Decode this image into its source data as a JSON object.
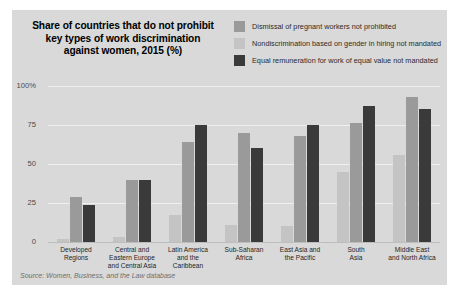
{
  "figure": {
    "title_lines": [
      "Share of countries that do not prohibit",
      "key types of work discrimination",
      "against women, 2015 (%)"
    ],
    "source_note": "Source: Women, Business, and the Law database",
    "panel_background": "#d9d9d9",
    "gridline_color": "#efefef"
  },
  "legend": {
    "position": "top-right",
    "items": [
      {
        "label": "Dismissal of pregnant workers not prohibited",
        "color": "#9a9a9a"
      },
      {
        "label": "Nondiscrimination based on gender in hiring not mandated",
        "color": "#c4c4c4"
      },
      {
        "label": "Equal remuneration for work of equal value not mandated",
        "color": "#3a3a3a"
      }
    ]
  },
  "chart_data": {
    "type": "bar",
    "xlabel": "",
    "ylabel": "",
    "ylim": [
      0,
      100
    ],
    "yticks": [
      "0",
      "25",
      "50",
      "75",
      "100%"
    ],
    "ytick_values": [
      0,
      25,
      50,
      75,
      100
    ],
    "grid": true,
    "legend_position": "top-right",
    "categories": [
      "Developed Regions",
      "Central and Eastern Europe and Central Asia",
      "Latin America and the Caribbean",
      "Sub-Saharan Africa",
      "East Asia and the Pacific",
      "South Asia",
      "Middle East and North Africa"
    ],
    "category_lines": [
      [
        "Developed",
        "Regions"
      ],
      [
        "Central and",
        "Eastern Europe",
        "and Central Asia"
      ],
      [
        "Latin America",
        "and the Caribbean"
      ],
      [
        "Sub-Saharan",
        "Africa"
      ],
      [
        "East Asia and",
        "the Pacific"
      ],
      [
        "South",
        "Asia"
      ],
      [
        "Middle East",
        "and North Africa"
      ]
    ],
    "series": [
      {
        "name": "Dismissal of pregnant workers not prohibited",
        "color": "#9a9a9a",
        "values": [
          29,
          40,
          64,
          70,
          68,
          76,
          93
        ]
      },
      {
        "name": "Nondiscrimination based on gender in hiring not mandated",
        "color": "#c4c4c4",
        "values": [
          2,
          3,
          17,
          11,
          10,
          45,
          56
        ]
      },
      {
        "name": "Equal remuneration for work of equal value not mandated",
        "color": "#3a3a3a",
        "values": [
          24,
          40,
          75,
          60,
          75,
          87,
          85
        ]
      }
    ],
    "series_draw_order": [
      "Nondiscrimination based on gender in hiring not mandated",
      "Dismissal of pregnant workers not prohibited",
      "Equal remuneration for work of equal value not mandated"
    ]
  }
}
